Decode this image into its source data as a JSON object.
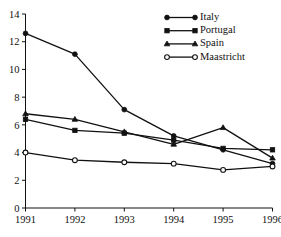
{
  "chart_data": {
    "type": "line",
    "title": "",
    "subtitle": "",
    "xlabel": "",
    "ylabel": "",
    "x": [
      1991,
      1992,
      1993,
      1994,
      1995,
      1996
    ],
    "xtick_labels": [
      "1991",
      "1992",
      "1993",
      "1994",
      "1995",
      "1996"
    ],
    "ytick_labels": [
      "0",
      "2",
      "4",
      "6",
      "8",
      "10",
      "12",
      "14"
    ],
    "yticks": [
      0,
      2,
      4,
      6,
      8,
      10,
      12,
      14
    ],
    "xlim": [
      1991,
      1996
    ],
    "ylim": [
      0,
      14
    ],
    "grid": false,
    "legend_position": "top-right",
    "series": [
      {
        "name": "Italy",
        "marker": "filled-circle",
        "values": [
          12.6,
          11.1,
          7.1,
          5.2,
          4.2,
          3.2
        ]
      },
      {
        "name": "Portugal",
        "marker": "filled-square",
        "values": [
          6.4,
          5.6,
          5.4,
          4.9,
          4.3,
          4.2
        ]
      },
      {
        "name": "Spain",
        "marker": "filled-triangle",
        "values": [
          6.8,
          6.4,
          5.5,
          4.6,
          5.8,
          3.6
        ]
      },
      {
        "name": "Maastricht",
        "marker": "open-circle",
        "values": [
          4.0,
          3.45,
          3.3,
          3.2,
          2.75,
          3.0
        ]
      }
    ]
  },
  "legend": {
    "entries": [
      {
        "label": "Italy"
      },
      {
        "label": "Portugal"
      },
      {
        "label": "Spain"
      },
      {
        "label": "Maastricht"
      }
    ]
  }
}
